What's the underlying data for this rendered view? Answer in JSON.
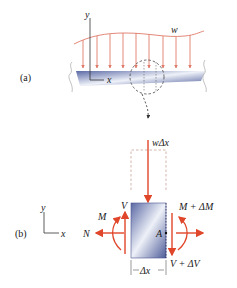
{
  "figure": {
    "part_a": {
      "label": "(a)",
      "axis_y": "y",
      "axis_x": "x",
      "load_label": "w"
    },
    "part_b": {
      "label": "(b)",
      "axis_y": "y",
      "axis_x": "x",
      "load_label": "wΔx",
      "shear_left": "V",
      "moment_left": "M",
      "normal_left": "N",
      "point": "A",
      "moment_right": "M + ΔM",
      "shear_right": "V + ΔV",
      "width_label": "Δx"
    },
    "colors": {
      "force": "#e0462a",
      "load_line": "#e07a6a",
      "beam_dark": "#5b6aa6",
      "beam_light": "#e8ecf6",
      "text": "#1a1a1a"
    }
  }
}
